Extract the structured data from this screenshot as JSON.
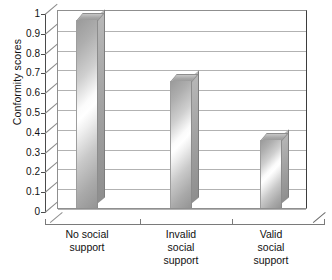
{
  "chart_data": {
    "type": "bar",
    "title": "",
    "subtitle": "",
    "xlabel": "",
    "ylabel": "Conformity scores",
    "categories": [
      "No social support",
      "Invalid social support",
      "Valid social support"
    ],
    "category_lines": [
      [
        "No social",
        "support"
      ],
      [
        "Invalid",
        "social",
        "support"
      ],
      [
        "Valid",
        "social",
        "support"
      ]
    ],
    "values": [
      0.95,
      0.64,
      0.345
    ],
    "ylim": [
      0,
      1
    ],
    "ytick_values": [
      1,
      0.9,
      0.8,
      0.7,
      0.6,
      0.5,
      0.4,
      0.3,
      0.2,
      0.1,
      0
    ],
    "ytick_labels": [
      "1",
      "0.9",
      "0.8",
      "0.7",
      "0.6",
      "0.5",
      "0.4",
      "0.3",
      "0.2",
      "0.1",
      "0"
    ],
    "grid": true,
    "legend": false,
    "legend_position": "none",
    "style": "3d-column",
    "colors": {
      "bar_dark": "#949494",
      "bar_mid": "#bfbfbf",
      "bar_highlight": "#ffffff",
      "gridline": "#b2b2b2",
      "axis": "#4a4a4a",
      "plot_background": "#ffffff",
      "text": "#111111"
    },
    "annotations": []
  }
}
